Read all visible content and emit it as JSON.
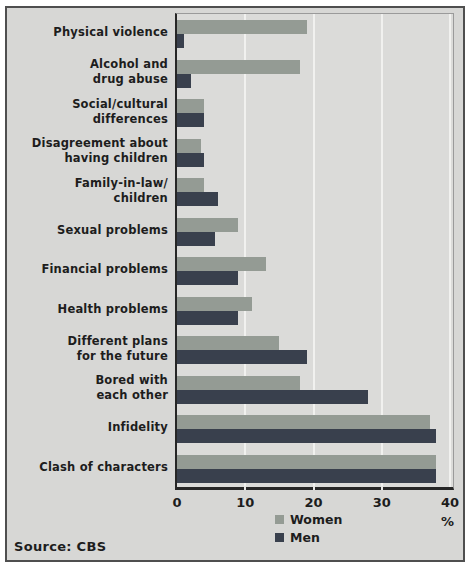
{
  "chart_data": {
    "type": "bar",
    "orientation": "horizontal",
    "title": "",
    "xlabel": "%",
    "ylabel": "",
    "xlim": [
      0,
      40
    ],
    "x_ticks": [
      0,
      10,
      20,
      30,
      40
    ],
    "grid": "vertical-white-gridlines",
    "legend_position": "bottom-center",
    "categories": [
      "Physical violence",
      "Alcohol and drug abuse",
      "Social/cultural differences",
      "Disagreement about having children",
      "Family-in-law/ children",
      "Sexual problems",
      "Financial problems",
      "Health problems",
      "Different plans for the future",
      "Bored with each other",
      "Infidelity",
      "Clash of characters"
    ],
    "category_display_lines": [
      [
        "Physical violence"
      ],
      [
        "Alcohol and",
        "drug abuse"
      ],
      [
        "Social/cultural",
        "differences"
      ],
      [
        "Disagreement about",
        "having children"
      ],
      [
        "Family-in-law/",
        "children"
      ],
      [
        "Sexual problems"
      ],
      [
        "Financial problems"
      ],
      [
        "Health problems"
      ],
      [
        "Different plans",
        "for the future"
      ],
      [
        "Bored with",
        "each other"
      ],
      [
        "Infidelity"
      ],
      [
        "Clash of characters"
      ]
    ],
    "series": [
      {
        "name": "Women",
        "color": "#949b94",
        "values": [
          19,
          18,
          4,
          3.5,
          4,
          9,
          13,
          11,
          15,
          18,
          37,
          38
        ]
      },
      {
        "name": "Men",
        "color": "#39404d",
        "values": [
          1,
          2,
          4,
          4,
          6,
          5.5,
          9,
          9,
          19,
          28,
          38,
          38
        ]
      }
    ],
    "source": "Source: CBS"
  },
  "colors": {
    "frame_background": "#d7d7d5",
    "plot_background": "#dbdbd9",
    "gridline": "#f1f1ef",
    "axis": "#262626",
    "frame_border": "#4f4f4f",
    "text": "#1d1d1d",
    "women_bar": "#949b94",
    "men_bar": "#39404d"
  }
}
